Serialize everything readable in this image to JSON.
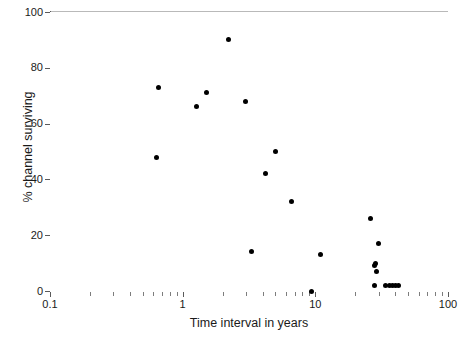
{
  "chart_data": {
    "type": "scatter",
    "title": "",
    "xlabel": "Time interval in years",
    "ylabel": "% channel surviving",
    "xscale": "log",
    "yscale": "linear",
    "xlim": [
      0.1,
      100
    ],
    "ylim": [
      0,
      100
    ],
    "grid": false,
    "legend": null,
    "x_ticks": [
      "0.1",
      "1",
      "10",
      "100"
    ],
    "x_tick_values": [
      0.1,
      1,
      10,
      100
    ],
    "y_ticks": [
      "0",
      "20",
      "40",
      "60",
      "80",
      "100"
    ],
    "y_tick_values": [
      0,
      20,
      40,
      60,
      80,
      100
    ],
    "marker": "filled-circle",
    "marker_color": "#000000",
    "points": [
      {
        "x": 0.64,
        "y": 48
      },
      {
        "x": 0.66,
        "y": 73
      },
      {
        "x": 1.27,
        "y": 66
      },
      {
        "x": 1.5,
        "y": 71
      },
      {
        "x": 2.2,
        "y": 90
      },
      {
        "x": 3.0,
        "y": 68
      },
      {
        "x": 3.3,
        "y": 14
      },
      {
        "x": 4.2,
        "y": 42
      },
      {
        "x": 5.0,
        "y": 50
      },
      {
        "x": 6.6,
        "y": 32
      },
      {
        "x": 9.3,
        "y": 0
      },
      {
        "x": 11.0,
        "y": 13
      },
      {
        "x": 26.0,
        "y": 26
      },
      {
        "x": 30.0,
        "y": 17
      },
      {
        "x": 28.5,
        "y": 10
      },
      {
        "x": 28.0,
        "y": 9
      },
      {
        "x": 29.0,
        "y": 7
      },
      {
        "x": 28.0,
        "y": 2
      },
      {
        "x": 34.0,
        "y": 2
      },
      {
        "x": 36.0,
        "y": 2
      },
      {
        "x": 38.0,
        "y": 2
      },
      {
        "x": 40.0,
        "y": 2
      },
      {
        "x": 42.0,
        "y": 2
      }
    ]
  },
  "axes": {
    "x_minor_ticks": [
      0.2,
      0.3,
      0.4,
      0.5,
      0.6,
      0.7,
      0.8,
      0.9,
      2,
      3,
      4,
      5,
      6,
      7,
      8,
      9,
      20,
      30,
      40,
      50,
      60,
      70,
      80,
      90
    ]
  }
}
